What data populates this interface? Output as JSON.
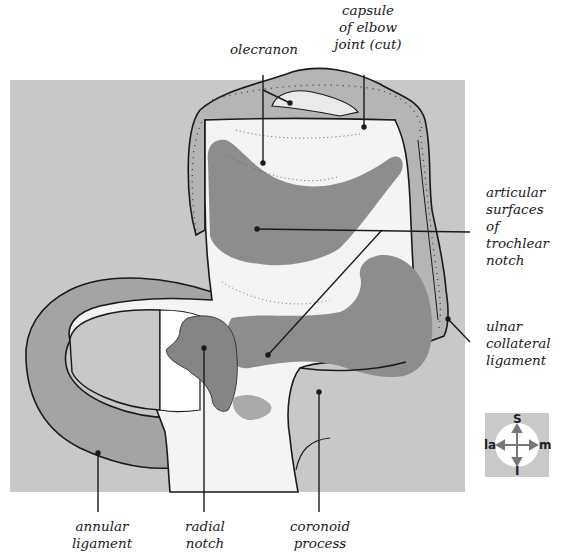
{
  "figure": {
    "colors": {
      "background_panel": "#c8c8c8",
      "articular_surface": "#8d8d8d",
      "ligament": "#a4a4a4",
      "bone": "#ffffff",
      "outline": "#1a1a1a"
    }
  },
  "labels": {
    "capsule": "capsule\nof elbow\njoint (cut)",
    "olecranon": "olecranon",
    "articular": "articular\nsurfaces\nof\ntrochlear\nnotch",
    "ulnar_collateral": "ulnar\ncollateral\nligament",
    "annular": "annular\nligament",
    "radial_notch": "radial\nnotch",
    "coronoid": "coronoid\nprocess"
  },
  "orientation": {
    "superior": "S",
    "inferior": "I",
    "lateral": "la",
    "medial": "m"
  }
}
